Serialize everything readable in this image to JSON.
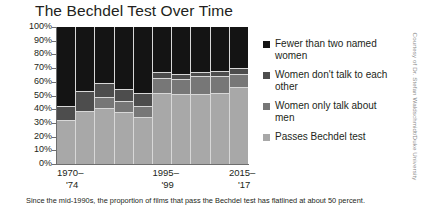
{
  "chart_data": {
    "type": "bar",
    "title": "The Bechdel Test Over Time",
    "xlabel": "",
    "ylabel": "",
    "ylim": [
      0,
      100
    ],
    "grid": false,
    "stacked": true,
    "legend_position": "right",
    "categories": [
      "1970–'74",
      "1975–'79",
      "1980–'84",
      "1985–'89",
      "1990–'94",
      "1995–'99",
      "2000–'04",
      "2005–'09",
      "2010–'14",
      "2015–'17"
    ],
    "ytick_labels": [
      "100%",
      "90%",
      "80%",
      "70%",
      "60%",
      "50%",
      "40%",
      "30%",
      "20%",
      "10%",
      "0%"
    ],
    "ytick_values": [
      100,
      90,
      80,
      70,
      60,
      50,
      40,
      30,
      20,
      10,
      0
    ],
    "xtick_labels": [
      {
        "line1": "1970–",
        "line2": "'74"
      },
      {
        "line1": "1995–",
        "line2": "'99"
      },
      {
        "line1": "2015–",
        "line2": "'17"
      }
    ],
    "series": [
      {
        "name": "Fewer than two named women",
        "color": "#141414",
        "values": [
          58,
          47,
          41,
          45,
          48,
          33,
          34,
          33,
          32,
          30
        ]
      },
      {
        "name": "Women don't talk to each other",
        "color": "#4d4d4d",
        "values": [
          10,
          14,
          10,
          9,
          10,
          4,
          4,
          3,
          4,
          4
        ]
      },
      {
        "name": "Women only talk about men",
        "color": "#777777",
        "values": [
          0,
          0,
          8,
          8,
          8,
          11,
          11,
          13,
          12,
          10
        ]
      },
      {
        "name": "Passes Bechdel test",
        "color": "#a8a8a8",
        "values": [
          32,
          39,
          41,
          38,
          34,
          52,
          51,
          51,
          52,
          56
        ]
      }
    ],
    "footnote": "Since the mid-1990s, the proportion of films that pass the Bechdel test has flatlined at about 50 percent.",
    "credit": "Courtesy of Dr. Stefan Waldschmidt/Duke University"
  }
}
